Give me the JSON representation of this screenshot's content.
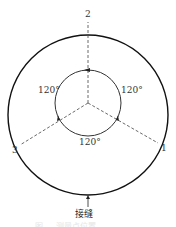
{
  "diagram": {
    "points": [
      {
        "label": "1"
      },
      {
        "label": "2"
      },
      {
        "label": "3"
      }
    ],
    "angles": [
      {
        "label": "120°"
      },
      {
        "label": "120°"
      },
      {
        "label": "120°"
      }
    ],
    "seam_label": "接缝",
    "caption": "图 ... 测量点位置"
  }
}
